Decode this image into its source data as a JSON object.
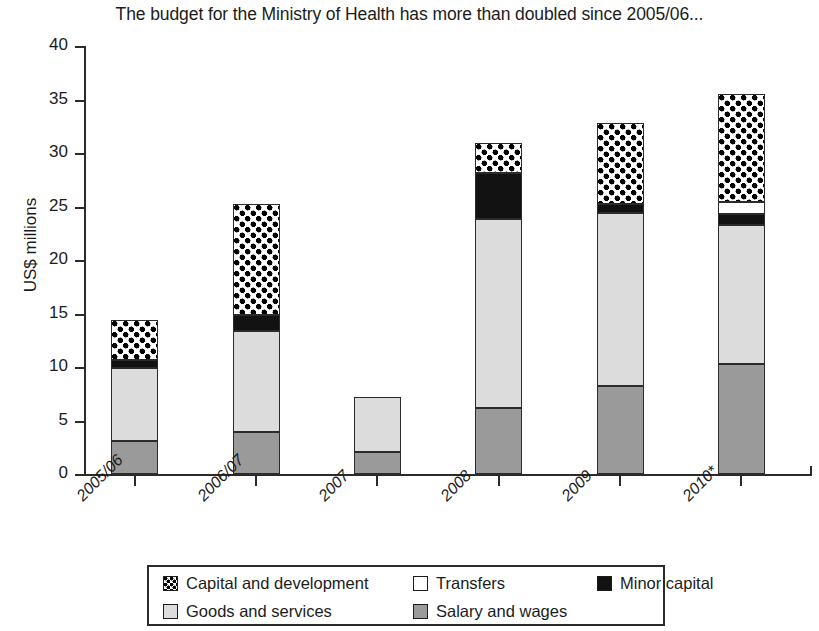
{
  "chart_data": {
    "type": "bar",
    "subtype": "stacked-bar",
    "title": "The budget for the Ministry of Health has more than doubled since 2005/06...",
    "xlabel": "",
    "ylabel": "US$ millions",
    "ylim": [
      0,
      40
    ],
    "ytick_step": 5,
    "yticks": [
      0,
      5,
      10,
      15,
      20,
      25,
      30,
      35,
      40
    ],
    "ytick_labels": [
      "0",
      "5",
      "10",
      "15",
      "20",
      "25",
      "30",
      "35",
      "40"
    ],
    "grid": false,
    "legend_position": "bottom",
    "categories": [
      "2005/06",
      "2006/07",
      "2007",
      "2008",
      "2009",
      "2010*"
    ],
    "series": [
      {
        "name": "Salary and wages",
        "key": "salary",
        "fill": "#9a9a9a",
        "values": [
          3.1,
          3.9,
          2.1,
          6.2,
          8.2,
          10.3
        ]
      },
      {
        "name": "Goods and services",
        "key": "goods",
        "fill": "#dcdcdc",
        "values": [
          6.8,
          9.5,
          5.1,
          17.6,
          16.2,
          13.0
        ]
      },
      {
        "name": "Minor capital",
        "key": "minor",
        "fill": "#121212",
        "values": [
          0.8,
          1.5,
          0.0,
          4.3,
          0.8,
          1.0
        ]
      },
      {
        "name": "Transfers",
        "key": "transfers",
        "fill": "#ffffff",
        "values": [
          0.0,
          0.0,
          0.0,
          0.0,
          0.0,
          1.1
        ]
      },
      {
        "name": "Capital and development",
        "key": "capital",
        "fill": "checker",
        "values": [
          3.7,
          10.3,
          0.0,
          2.8,
          7.6,
          10.1
        ]
      }
    ],
    "totals": [
      14.4,
      25.2,
      7.2,
      30.9,
      32.8,
      35.5
    ],
    "stack_order": [
      "salary",
      "goods",
      "minor",
      "transfers",
      "capital"
    ]
  },
  "legend": {
    "row1": [
      {
        "label": "Capital and development",
        "key": "capital"
      },
      {
        "label": "Transfers",
        "key": "transfers"
      },
      {
        "label": "Minor capital",
        "key": "minor"
      }
    ],
    "row2": [
      {
        "label": "Goods and services",
        "key": "goods"
      },
      {
        "label": "Salary and wages",
        "key": "salary"
      }
    ]
  },
  "colors": {
    "salary": "#9a9a9a",
    "goods": "#dcdcdc",
    "minor": "#121212",
    "transfers": "#ffffff",
    "axis": "#2b2b2b",
    "text": "#1c1c1c"
  }
}
